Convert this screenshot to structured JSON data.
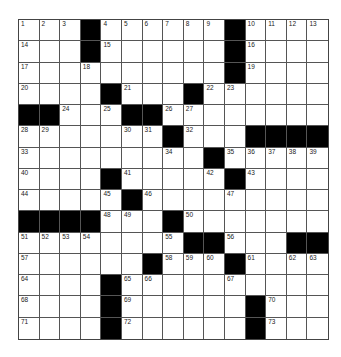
{
  "puzzle": {
    "rows": 15,
    "cols": 15,
    "colors": {
      "block": "#000000",
      "cell": "#ffffff",
      "line": "#555555"
    },
    "grid": [
      "...#......#....",
      "...#......#....",
      "..........#....",
      "....#...#......",
      "##...##........",
      ".......#...####",
      ".........#.....",
      "....#.....#....",
      ".....#.........",
      "####...#.......",
      "........##...##",
      "......#...#....",
      "....#..........",
      "....#......#...",
      "....#......#..."
    ],
    "numbers": [
      [
        1,
        2,
        3,
        0,
        4,
        5,
        6,
        7,
        8,
        9,
        0,
        10,
        11,
        12,
        13
      ],
      [
        14,
        0,
        0,
        0,
        15,
        0,
        0,
        0,
        0,
        0,
        0,
        16,
        0,
        0,
        0
      ],
      [
        17,
        0,
        0,
        18,
        0,
        0,
        0,
        0,
        0,
        0,
        0,
        19,
        0,
        0,
        0
      ],
      [
        20,
        0,
        0,
        0,
        0,
        21,
        0,
        0,
        0,
        22,
        23,
        0,
        0,
        0,
        0
      ],
      [
        0,
        0,
        24,
        0,
        25,
        0,
        0,
        26,
        27,
        0,
        0,
        0,
        0,
        0,
        0
      ],
      [
        28,
        29,
        0,
        0,
        0,
        30,
        31,
        0,
        32,
        0,
        0,
        0,
        0,
        0,
        0
      ],
      [
        33,
        0,
        0,
        0,
        0,
        0,
        0,
        34,
        0,
        0,
        35,
        36,
        37,
        38,
        39
      ],
      [
        40,
        0,
        0,
        0,
        0,
        41,
        0,
        0,
        0,
        42,
        0,
        43,
        0,
        0,
        0
      ],
      [
        44,
        0,
        0,
        0,
        45,
        0,
        46,
        0,
        0,
        0,
        47,
        0,
        0,
        0,
        0
      ],
      [
        0,
        0,
        0,
        0,
        48,
        49,
        0,
        0,
        50,
        0,
        0,
        0,
        0,
        0,
        0
      ],
      [
        51,
        52,
        53,
        54,
        0,
        0,
        0,
        55,
        0,
        0,
        56,
        0,
        0,
        0,
        0
      ],
      [
        57,
        0,
        0,
        0,
        0,
        0,
        0,
        58,
        59,
        60,
        0,
        61,
        0,
        62,
        63
      ],
      [
        64,
        0,
        0,
        0,
        0,
        65,
        66,
        0,
        0,
        0,
        67,
        0,
        0,
        0,
        0
      ],
      [
        68,
        0,
        0,
        0,
        0,
        69,
        0,
        0,
        0,
        0,
        0,
        0,
        70,
        0,
        0
      ],
      [
        71,
        0,
        0,
        0,
        0,
        72,
        0,
        0,
        0,
        0,
        0,
        0,
        73,
        0,
        0
      ]
    ]
  }
}
